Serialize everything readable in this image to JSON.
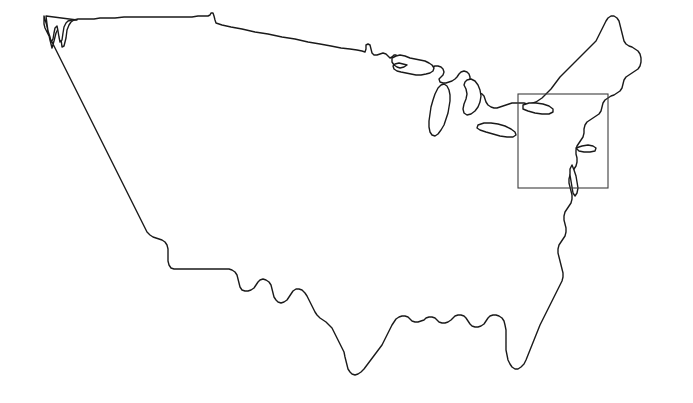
{
  "document": {
    "title": "United States Outline Map",
    "width": 693,
    "height": 403,
    "background_color": "#ffffff"
  },
  "style": {
    "coastline_color": "#1a1a1a",
    "coastline_width": 1.4,
    "lake_color": "#1a1a1a",
    "highlight_box_color": "#3d3d3d",
    "highlight_box_width": 1.1,
    "fill_color": "#ffffff"
  },
  "map": {
    "region_name": "Contiguous United States",
    "projection_note": "conic",
    "features": [
      {
        "name": "national-boundary",
        "type": "outline"
      },
      {
        "name": "great-lakes",
        "type": "water"
      },
      {
        "name": "long-island",
        "type": "island"
      },
      {
        "name": "highlight-rectangle",
        "type": "annotation"
      }
    ]
  },
  "highlight_box": {
    "label": "northeast-region-highlight",
    "x": 518,
    "y": 94,
    "width": 90,
    "height": 94
  },
  "geometry": {
    "mainland_path": "M 46 17 L 47 26 L 49 34 L 52 40 L 55 36 L 57 30 L 59 25 L 61 22 L 63 27 L 64 34 L 66 39 L 68 36 L 70 28 L 71 21 L 73 17 L 75 15 L 78 14 L 82 13 L 86 13 L 90 14 L 93 16 L 95 19 L 97 22 L 100 20 L 101 16 L 101 11 L 103 9 L 106 10 L 108 13 L 109 17 L 111 19 L 115 19 L 122 19 L 132 19 L 145 18 L 160 18 L 178 19 L 198 21 L 220 23 L 244 26 L 268 29 L 292 31 L 314 34 L 332 36 L 348 38 L 357 39 L 360 39 L 361 34 L 362 29 L 365 29 L 368 30 L 369 35 L 370 40 L 374 42 L 379 44 L 383 46 L 387 48 L 390 51 L 393 53 L 396 52 L 399 50 L 402 50 L 404 52 L 407 54 L 411 56 L 415 57 L 419 58 L 422 60 L 424 63 L 425 67 L 424 71 L 421 74 L 418 76 L 416 79 L 417 83 L 420 86 L 424 87 L 428 87 L 432 86 L 435 84 L 437 81 L 440 78 L 444 76 L 448 75 L 452 75 L 456 76 L 459 78 L 461 81 L 462 85 L 462 89 L 461 93 L 459 96 L 457 99 L 456 103 L 457 107 L 460 110 L 464 112 L 468 113 L 472 114 L 476 116 L 479 119 L 481 123 L 483 127 L 486 130 L 490 132 L 495 133 L 500 133 L 505 132 L 509 130 L 513 128 L 517 126 L 521 124 L 526 123 L 531 122 L 536 122 L 540 123 L 544 124 L 548 124 L 552 122 L 555 119 L 557 115 L 558 111 L 560 107 L 563 103 L 566 99 L 569 95 L 572 91 L 575 87 L 578 83 L 581 79 L 584 75 L 587 71 L 590 67 L 593 63 L 596 59 L 599 55 L 602 51 L 605 47 L 608 43 L 611 39 L 613 35 L 615 30 L 617 25 L 619 21 L 622 18 L 626 16 L 630 16 L 633 18 L 635 22 L 636 27 L 637 32 L 638 37 L 640 41 L 643 44 L 647 46 L 651 47 L 655 49 L 658 52 L 660 56 L 661 61 L 660 66 L 658 70 L 655 73 L 651 75 L 647 77 L 644 80 L 642 84 L 641 89 L 639 94 L 636 98 L 632 101 L 628 103 L 624 105 L 621 108 L 619 112 L 617 117 L 614 121 L 611 125 L 607 128 L 603 131 L 600 134 L 598 138 L 597 143 L 596 148 L 594 152 L 591 156 L 588 159 L 585 162 L 583 166 L 582 171 L 581 176 L 580 181 L 580 186 L 581 191 L 582 196 L 582 201 L 581 206 L 579 210 L 576 214 L 573 217 L 570 221 L 568 226 L 567 231 L 566 236 L 564 241 L 561 245 L 558 249 L 556 254 L 555 259 L 555 264 L 556 269 L 558 274 L 560 279 L 562 284 L 564 289 L 565 294 L 565 299 L 564 304 L 562 309 L 560 314 L 558 319 L 556 324 L 554 329 L 552 334 L 550 339 L 547 344 L 544 349 L 541 354 L 538 359 L 535 363 L 532 367 L 529 370 L 526 372 L 523 373 L 521 371 L 520 367 L 520 362 L 521 357 L 523 352 L 525 347 L 527 342 L 529 337 L 531 332 L 532 327 L 533 322 L 533 317 L 532 312 L 530 308 L 527 305 L 524 303 L 520 302 L 516 302 L 512 303 L 508 305 L 505 308 L 503 312 L 501 316 L 499 320 L 496 323 L 492 325 L 488 326 L 484 326 L 480 325 L 477 323 L 474 320 L 472 317 L 470 314 L 467 312 L 463 311 L 459 311 L 455 312 L 452 314 L 450 317 L 448 320 L 445 322 L 441 323 L 437 323 L 434 322 L 432 320 L 430 317 L 428 315 L 425 314 L 421 314 L 417 315 L 414 317 L 411 319 L 408 320 L 404 321 L 400 321 L 396 320 L 393 318 L 390 316 L 387 315 L 383 315 L 379 316 L 376 318 L 373 320 L 370 323 L 368 327 L 366 331 L 364 335 L 362 340 L 360 345 L 357 350 L 354 355 L 351 360 L 348 365 L 345 370 L 342 375 L 339 379 L 336 382 L 333 384 L 330 384 L 327 383 L 325 380 L 323 376 L 322 371 L 321 366 L 320 361 L 318 356 L 316 351 L 314 346 L 312 341 L 310 336 L 308 331 L 306 327 L 303 323 L 300 320 L 297 318 L 294 316 L 291 313 L 289 310 L 287 306 L 285 302 L 283 298 L 281 294 L 279 290 L 276 287 L 273 285 L 270 285 L 267 286 L 265 289 L 263 292 L 261 296 L 259 299 L 256 301 L 253 302 L 250 301 L 248 299 L 246 296 L 245 292 L 244 288 L 243 284 L 241 281 L 238 279 L 235 278 L 232 279 L 230 281 L 228 284 L 226 287 L 223 289 L 220 290 L 217 290 L 214 289 L 212 286 L 211 282 L 210 278 L 209 274 L 207 271 L 204 269 L 201 268 L 198 268 L 195 268 L 192 268 L 189 268 L 186 268 L 183 268 L 180 268 L 177 268 L 174 268 L 171 268 L 168 268 L 165 268 L 162 268 L 159 268 L 156 268 L 153 268 L 150 268 L 147 268 L 145 266 L 144 262 L 144 258 L 144 254 L 144 250 L 143 246 L 141 243 L 138 241 L 135 240 L 132 239 L 129 238 L 126 236 L 123 233 L 121 229 L 119 225 L 117 221 L 115 217 L 113 213 L 111 209 L 109 205 L 107 201 L 105 197 L 103 193 L 101 189 L 99 185 L 97 181 L 96 177 L 95 173 L 94 169 L 93 165 L 92 161 L 90 157 L 88 153 L 86 150 L 84 147 L 82 144 L 80 141 L 78 138 L 76 134 L 74 130 L 72 126 L 70 122 L 68 118 L 66 114 L 64 110 L 62 106 L 60 102 L 58 98 L 56 94 L 54 90 L 52 86 L 50 82 L 49 78 L 48 74 L 47 70 L 46 66 L 46 62 L 46 58 L 46 54 L 46 50 L 46 46 L 46 42 L 46 38 L 46 34 L 46 30 L 46 26 L 46 22 Z",
    "description": "Outline of the lower 48 United States with Great Lakes, Florida peninsula, Texas gulf coast, Pacific coast, and New England."
  }
}
